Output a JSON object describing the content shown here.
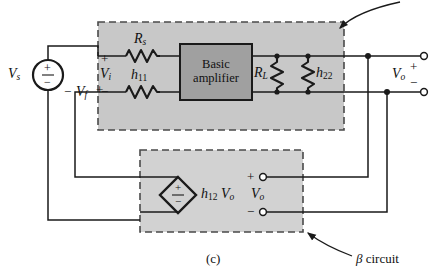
{
  "figure": {
    "caption": "(c)",
    "title_note": "series-shunt feedback amplifier h-parameter model"
  },
  "colors": {
    "outer_block_fill": "#c8c8c8",
    "beta_block_fill": "#d2d2d2",
    "amplifier_fill": "#a0a0a0",
    "wire": "#1a1a1a",
    "dashed_border": "#4a4a4a",
    "page_background": "#ffffff"
  },
  "labels": {
    "source": "V",
    "source_sub": "s",
    "feedback_voltage": "V",
    "feedback_voltage_sub": "f",
    "input_voltage": "V",
    "input_voltage_sub": "i",
    "output_voltage": "V",
    "output_voltage_sub": "o",
    "beta_output_voltage": "V",
    "beta_output_voltage_sub": "o",
    "plus": "+",
    "minus": "−"
  },
  "components": {
    "series_resistor": {
      "name": "R",
      "sub": "s"
    },
    "input_resistance": {
      "name": "h",
      "sub": "11"
    },
    "load_resistor": {
      "name": "R",
      "sub": "L"
    },
    "output_conductance": {
      "name": "h",
      "sub": "22"
    },
    "amplifier_block": {
      "line1": "Basic",
      "line2": "amplifier"
    },
    "dependent_source": {
      "name": "h",
      "sub": "12",
      "multiplier": "V",
      "multiplier_sub": "o"
    }
  },
  "annotations": {
    "beta_circuit": {
      "greek": "β",
      "text": " circuit"
    },
    "amplifier_arrow_target": "basic amplifier block"
  },
  "terminal_signs": {
    "input_plus": "+",
    "input_minus": "−",
    "feedback_minus": "−",
    "feedback_plus": "+",
    "output_plus": "+",
    "output_minus": "−",
    "beta_plus": "+",
    "beta_minus": "−",
    "source_plus": "+",
    "source_minus": "−",
    "dep_plus": "+",
    "dep_minus": "−"
  }
}
